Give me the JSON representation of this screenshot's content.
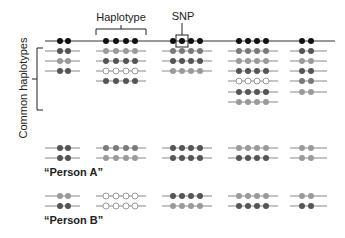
{
  "labels": {
    "haplotype": "Haplotype",
    "snp": "SNP",
    "common_haplotypes": "Common haplotypes",
    "person_a": "“Person A”",
    "person_b": "“Person B”"
  },
  "colors": {
    "black": "#111111",
    "dark": "#555555",
    "mid": "#7a7a7a",
    "light": "#9a9a9a",
    "empty": "#ffffff",
    "line": "#888888"
  },
  "blocks": [
    {
      "x": [
        60,
        68
      ],
      "line": [
        45,
        80
      ],
      "common": [
        "dark",
        "light",
        "dark"
      ]
    },
    {
      "x": [
        106,
        116,
        126,
        135
      ],
      "line": [
        96,
        146
      ],
      "common": [
        "light",
        "dark",
        "empty",
        "dark"
      ]
    },
    {
      "x": [
        173,
        182,
        191,
        200
      ],
      "line": [
        162,
        212
      ],
      "common": [
        "mid",
        "dark",
        "light"
      ]
    },
    {
      "x": [
        239,
        248,
        257,
        266
      ],
      "line": [
        228,
        278
      ],
      "common": [
        "mid",
        "light",
        "dark",
        "empty",
        "dark",
        "light"
      ]
    },
    {
      "x": [
        302,
        311
      ],
      "line": [
        290,
        327
      ],
      "common": [
        "dark",
        "light",
        "dark",
        "mid",
        "light"
      ]
    }
  ],
  "person_a": {
    "rows": [
      [
        "dark",
        "mid",
        "dark",
        "light",
        "light"
      ],
      [
        "dark",
        "light",
        "dark",
        "dark",
        "light"
      ]
    ]
  },
  "person_b": {
    "rows": [
      [
        "light",
        "empty",
        "dark",
        "light",
        "light"
      ],
      [
        "dark",
        "empty",
        "light",
        "dark",
        "dark"
      ]
    ]
  }
}
